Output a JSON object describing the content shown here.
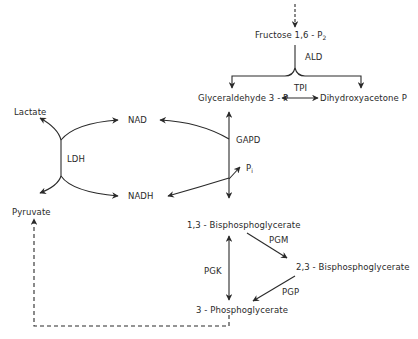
{
  "diagram": {
    "metabolites": {
      "fructose": "Fructose  1,6 - P",
      "fructose_sub": "2",
      "gap": "Glyceraldehyde  3 - P",
      "dhap": "Dihydroxyacetone   P",
      "lactate": "Lactate",
      "pyruvate": "Pyruvate",
      "nad": "NAD",
      "nadh": "NADH",
      "pi": "P",
      "pi_sub": "i",
      "bpg13": "1,3 - Bisphosphoglycerate",
      "bpg23": "2,3 - Bisphosphoglycerate",
      "pg3": "3 - Phosphoglycerate"
    },
    "enzymes": {
      "ald": "ALD",
      "tpi": "TPI",
      "gapd": "GAPD",
      "ldh": "LDH",
      "pgm": "PGM",
      "pgk": "PGK",
      "pgp": "PGP"
    },
    "colors": {
      "line": "#2a2a2a",
      "background": "#ffffff"
    }
  }
}
